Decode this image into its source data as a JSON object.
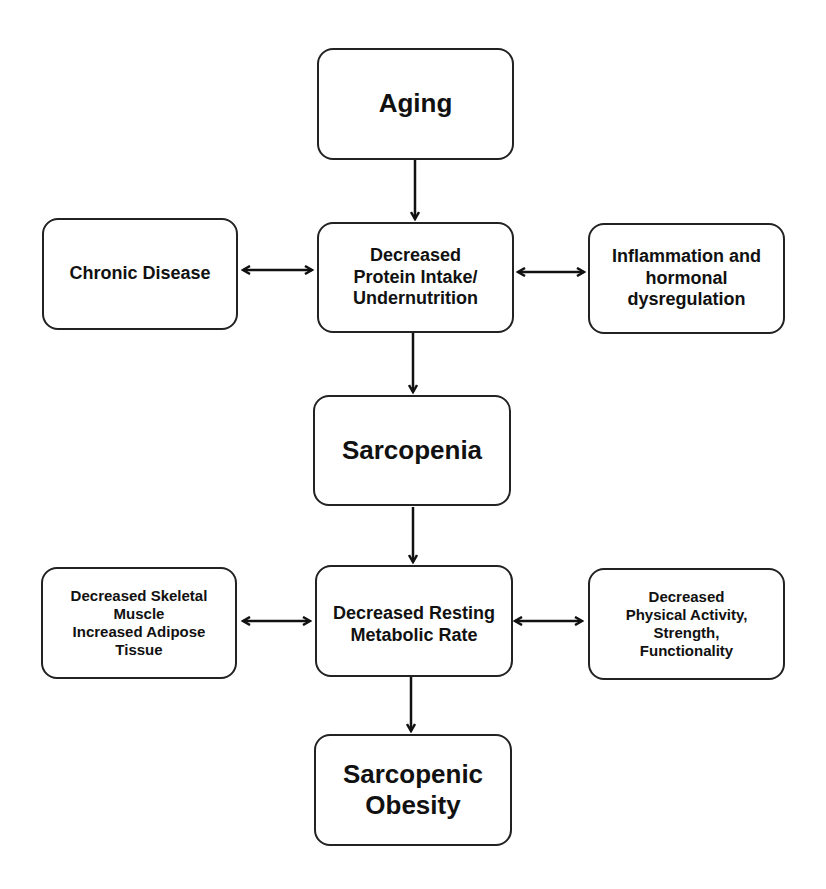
{
  "diagram": {
    "nodes": {
      "aging": {
        "label": "Aging"
      },
      "protein": {
        "label": "Decreased Protein Intake/ Undernutrition",
        "lines": [
          "Decreased",
          "Protein Intake/",
          "Undernutrition"
        ]
      },
      "chronic": {
        "label": "Chronic Disease"
      },
      "inflammation": {
        "label": "Inflammation and hormonal dysregulation",
        "lines": [
          "Inflammation and",
          "hormonal",
          "dysregulation"
        ]
      },
      "sarcopenia": {
        "label": "Sarcopenia"
      },
      "skeletal": {
        "label": "Decreased Skeletal Muscle Increased Adipose Tissue",
        "lines": [
          "Decreased Skeletal",
          "Muscle",
          "Increased Adipose",
          "Tissue"
        ]
      },
      "metabolic": {
        "label": "Decreased Resting Metabolic Rate",
        "lines": [
          "Decreased Resting",
          "Metabolic Rate"
        ]
      },
      "physical": {
        "label": "Decreased Physical Activity, Strength, Functionality",
        "lines": [
          "Decreased",
          "Physical Activity,",
          "Strength,",
          "Functionality"
        ]
      },
      "obesity": {
        "label": "Sarcopenic Obesity",
        "lines": [
          "Sarcopenic",
          "Obesity"
        ]
      }
    },
    "edges": [
      {
        "from": "aging",
        "to": "protein",
        "type": "directed"
      },
      {
        "from": "chronic",
        "to": "protein",
        "type": "bidirectional"
      },
      {
        "from": "protein",
        "to": "inflammation",
        "type": "bidirectional"
      },
      {
        "from": "protein",
        "to": "sarcopenia",
        "type": "directed"
      },
      {
        "from": "sarcopenia",
        "to": "metabolic",
        "type": "directed"
      },
      {
        "from": "skeletal",
        "to": "metabolic",
        "type": "bidirectional"
      },
      {
        "from": "metabolic",
        "to": "physical",
        "type": "bidirectional"
      },
      {
        "from": "metabolic",
        "to": "obesity",
        "type": "directed"
      }
    ]
  }
}
